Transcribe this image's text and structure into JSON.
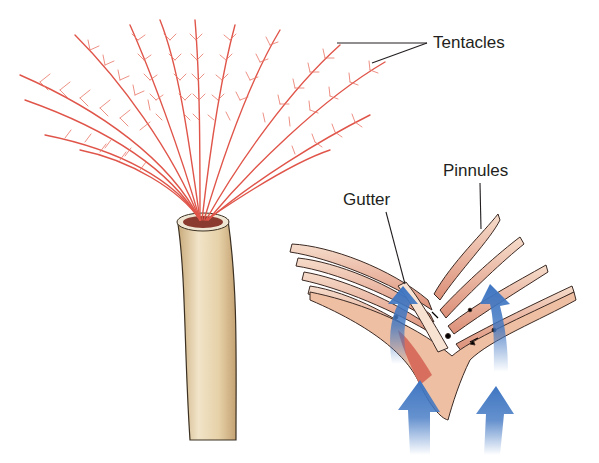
{
  "diagram": {
    "labels": {
      "tentacles": "Tentacles",
      "pinnules": "Pinnules",
      "gutter": "Gutter"
    },
    "colors": {
      "tentacle": "#e0554a",
      "tube": "#e2cfa6",
      "pinnule_fill": "#e8a88f",
      "pinnule_light": "#f3d3bd",
      "arrow": "#3f76c2",
      "leader_line": "#231f20"
    },
    "icons": [
      "water-flow-arrow-icon",
      "food-particle-arrow-icon"
    ]
  }
}
